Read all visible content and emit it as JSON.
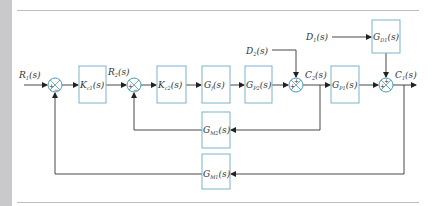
{
  "diagram": {
    "type": "block-diagram",
    "title": "",
    "inputs": [
      {
        "id": "R1",
        "main": "R",
        "sub": "1",
        "arg": "(s)"
      },
      {
        "id": "D2",
        "main": "D",
        "sub": "2",
        "arg": "(s)"
      },
      {
        "id": "D1",
        "main": "D",
        "sub": "1",
        "arg": "(s)"
      }
    ],
    "signals": [
      {
        "id": "R2",
        "main": "R",
        "sub": "2",
        "arg": "(s)"
      },
      {
        "id": "C2",
        "main": "C",
        "sub": "2",
        "arg": "(s)"
      },
      {
        "id": "C1",
        "main": "C",
        "sub": "1",
        "arg": "(s)"
      }
    ],
    "blocks": [
      {
        "id": "Kc1",
        "main": "K",
        "sub": "c1",
        "arg": "(s)"
      },
      {
        "id": "Kc2",
        "main": "K",
        "sub": "c2",
        "arg": "(s)"
      },
      {
        "id": "Gf",
        "main": "G",
        "sub": "f",
        "arg": "(s)"
      },
      {
        "id": "Gp2",
        "main": "G",
        "sub": "P2",
        "arg": "(s)"
      },
      {
        "id": "Gp1",
        "main": "G",
        "sub": "P1",
        "arg": "(s)"
      },
      {
        "id": "Gd1",
        "main": "G",
        "sub": "D1",
        "arg": "(s)"
      },
      {
        "id": "Gm2",
        "main": "G",
        "sub": "M2",
        "arg": "(s)"
      },
      {
        "id": "Gm1",
        "main": "G",
        "sub": "M1",
        "arg": "(s)"
      }
    ],
    "summing_junctions": [
      {
        "id": "S1",
        "signs": [
          "+",
          "−"
        ]
      },
      {
        "id": "S2",
        "signs": [
          "+",
          "−"
        ]
      },
      {
        "id": "S3",
        "signs": [
          "+",
          "+"
        ]
      },
      {
        "id": "S4",
        "signs": [
          "+",
          "+"
        ]
      }
    ],
    "edges": [
      "R1 -> S1(+)",
      "S1 -> Kc1",
      "Kc1 -> R2 -> S2(+)",
      "S2 -> Kc2",
      "Kc2 -> Gf",
      "Gf -> Gp2",
      "Gp2 -> S3(+)",
      "D2 -> S3(+)",
      "S3 -> C2 -> Gp1",
      "Gp1 -> S4(+)",
      "D1 -> Gd1",
      "Gd1 -> S4(+)",
      "S4 -> C1",
      "C2 -> Gm2 -> S2(−)",
      "C1 -> Gm1 -> S1(−)"
    ],
    "colors": {
      "block_border": "#7ab3cc",
      "junction": "#4a9bb5",
      "line": "#333333",
      "strip": "#c9c9cb",
      "rule": "#bdbdbd"
    }
  }
}
